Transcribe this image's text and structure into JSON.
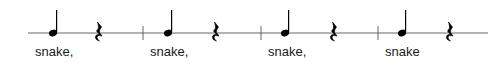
{
  "score": {
    "staff": {
      "type": "single-line percussion staff",
      "x_start": 28,
      "x_end": 488,
      "y": 33,
      "color": "#555555"
    },
    "measures": [
      {
        "note": {
          "type": "quarter-note",
          "stem": "up",
          "x": 53
        },
        "rest": {
          "type": "quarter-rest",
          "x": 99
        },
        "lyric": "snake,",
        "lyric_x": 35
      },
      {
        "note": {
          "type": "quarter-note",
          "stem": "up",
          "x": 168
        },
        "rest": {
          "type": "quarter-rest",
          "x": 216
        },
        "lyric": "snake,",
        "lyric_x": 150
      },
      {
        "note": {
          "type": "quarter-note",
          "stem": "up",
          "x": 285
        },
        "rest": {
          "type": "quarter-rest",
          "x": 334
        },
        "lyric": "snake,",
        "lyric_x": 268
      },
      {
        "note": {
          "type": "quarter-note",
          "stem": "up",
          "x": 402
        },
        "rest": {
          "type": "quarter-rest",
          "x": 450
        },
        "lyric": "snake",
        "lyric_x": 385
      }
    ],
    "barlines_x": [
      143,
      261,
      378
    ],
    "ink_color": "#000000"
  }
}
